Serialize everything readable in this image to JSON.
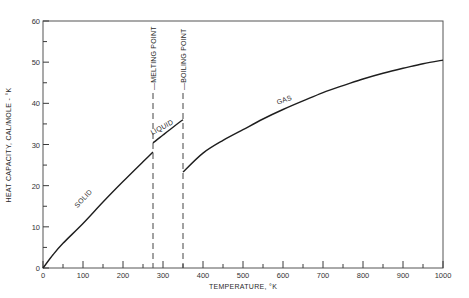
{
  "chart_data": {
    "type": "line",
    "title": "",
    "xlabel": "TEMPERATURE, °K",
    "ylabel": "HEAT CAPACITY, CAL/MOLE - °K",
    "xlim": [
      0,
      1000
    ],
    "ylim": [
      0,
      60
    ],
    "xticks": [
      0,
      100,
      200,
      300,
      400,
      500,
      600,
      700,
      800,
      900,
      1000
    ],
    "xticks_minor": [
      50,
      150,
      250,
      350,
      450,
      550,
      650,
      750,
      850,
      950
    ],
    "yticks": [
      0,
      10,
      20,
      30,
      40,
      50,
      60
    ],
    "yticks_minor": [
      5,
      15,
      25,
      35,
      45,
      55
    ],
    "grid": false,
    "legend": null,
    "series": [
      {
        "name": "SOLID",
        "x": [
          0,
          25,
          50,
          100,
          150,
          200,
          250,
          275
        ],
        "y": [
          0,
          3.2,
          6.0,
          10.8,
          16.0,
          21.0,
          25.8,
          28.2
        ]
      },
      {
        "name": "LIQUID",
        "x": [
          275,
          300,
          325,
          350
        ],
        "y": [
          30.4,
          32.3,
          34.2,
          36.0
        ]
      },
      {
        "name": "GAS",
        "x": [
          350,
          400,
          450,
          500,
          550,
          600,
          650,
          700,
          750,
          800,
          850,
          900,
          950,
          1000
        ],
        "y": [
          23.3,
          27.9,
          31.0,
          33.6,
          36.2,
          38.5,
          40.6,
          42.6,
          44.3,
          45.9,
          47.3,
          48.5,
          49.6,
          50.5
        ]
      }
    ],
    "annotations": [
      {
        "text": "SOLID",
        "x": 105,
        "y": 16,
        "rotation": -47
      },
      {
        "text": "LIQUID",
        "x": 300,
        "y": 33.2,
        "rotation": -28
      },
      {
        "text": "GAS",
        "x": 605,
        "y": 39.8,
        "rotation": -20
      },
      {
        "text": "MELTING POINT",
        "type": "vline",
        "x": 275,
        "style": "dashed"
      },
      {
        "text": "BOILING POINT",
        "type": "vline",
        "x": 350,
        "style": "dashed"
      }
    ]
  },
  "labels": {
    "xlabel": "TEMPERATURE, °K",
    "ylabel": "HEAT CAPACITY, CAL/MOLE - °K",
    "solid": "SOLID",
    "liquid": "LIQUID",
    "gas": "GAS",
    "melting": "MELTING POINT",
    "boiling": "BOILING POINT"
  }
}
